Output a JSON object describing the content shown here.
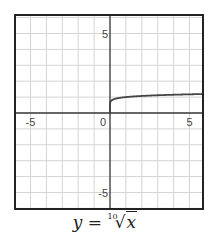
{
  "chart_data": {
    "type": "line",
    "function": "x^(1/10)",
    "xlabel": "",
    "ylabel": "",
    "xlim": [
      -6,
      5.8
    ],
    "ylim": [
      -5.9,
      6.2
    ],
    "grid": true,
    "x_ticks": [
      -5,
      0,
      5
    ],
    "y_ticks": [
      -5,
      5
    ],
    "x": [
      0,
      0.001,
      0.01,
      0.1,
      0.5,
      1,
      2,
      3,
      4,
      5,
      5.8
    ],
    "y": [
      0,
      0.501,
      0.631,
      0.794,
      0.933,
      1.0,
      1.072,
      1.116,
      1.149,
      1.175,
      1.192
    ]
  },
  "caption": {
    "lhs": "y =",
    "index": "10",
    "radical": "√",
    "radicand": "x"
  },
  "colors": {
    "grid": "#d4d4d4",
    "axis": "#333333",
    "frame": "#222222",
    "curve": "#444444"
  }
}
